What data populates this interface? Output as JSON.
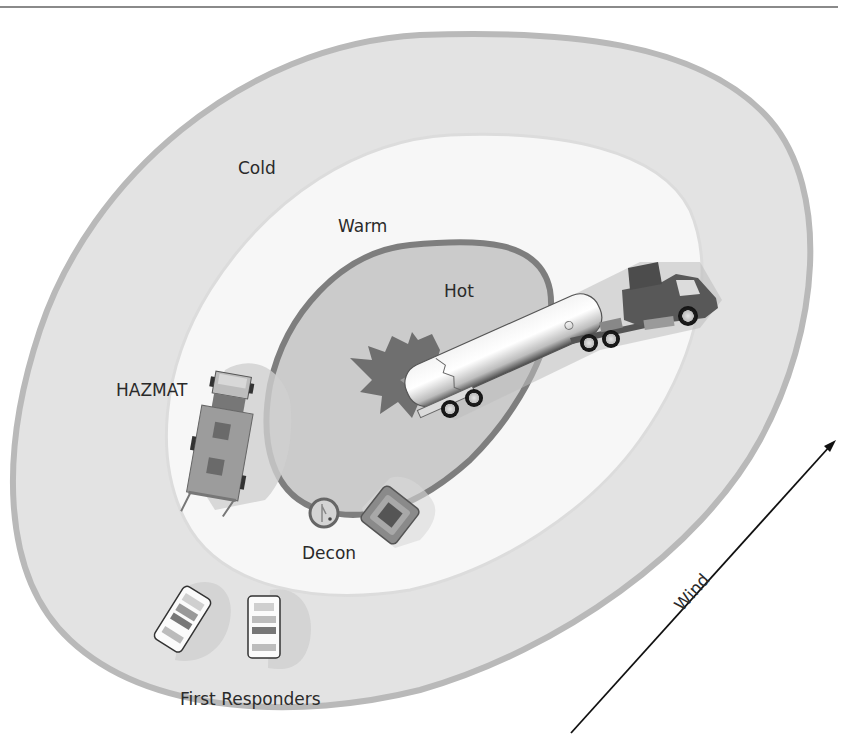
{
  "diagram": {
    "type": "hazmat-zone-diagram",
    "zones": [
      {
        "name": "Cold",
        "label": "Cold",
        "fill": "#e3e3e3",
        "border": "#b9b9b9"
      },
      {
        "name": "Warm",
        "label": "Warm",
        "fill": "#f6f6f6",
        "border": "#e0e0e0"
      },
      {
        "name": "Hot",
        "label": "Hot",
        "fill": "#c9c9c9",
        "border": "#7e7e7e"
      }
    ],
    "labels": {
      "cold": "Cold",
      "warm": "Warm",
      "hot": "Hot",
      "hazmat": "HAZMAT",
      "decon": "Decon",
      "first_responders": "First Responders",
      "wind": "Wind"
    },
    "objects": [
      {
        "name": "tanker-truck",
        "zone": "Hot"
      },
      {
        "name": "chemical-spill",
        "zone": "Hot"
      },
      {
        "name": "hazmat-truck",
        "zone": "Warm"
      },
      {
        "name": "decon-shower",
        "zone": "Warm"
      },
      {
        "name": "decon-pool",
        "zone": "Warm"
      },
      {
        "name": "police-car-1",
        "zone": "Cold"
      },
      {
        "name": "police-car-2",
        "zone": "Cold"
      }
    ],
    "wind_direction": "toward upper-right",
    "colors": {
      "top_rule": "#8a8a8a",
      "text": "#2a2a2a",
      "vehicle_dark": "#5a5a5a",
      "spill": "#6f6f6f"
    }
  }
}
